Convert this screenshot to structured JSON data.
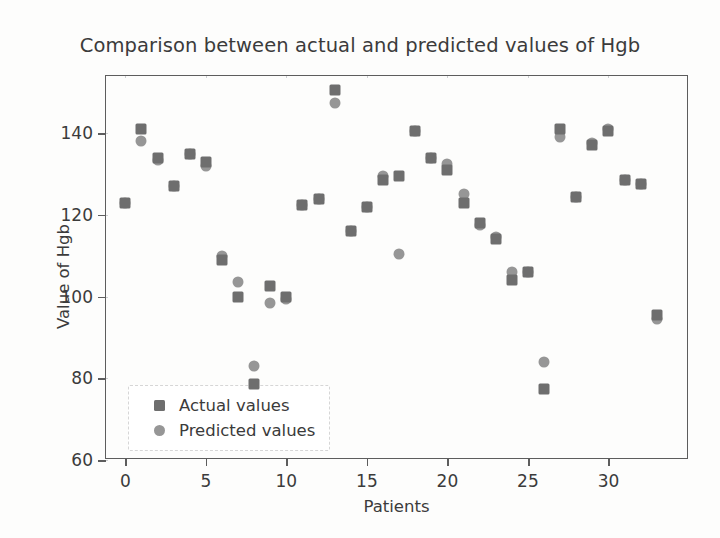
{
  "chart_data": {
    "type": "scatter",
    "title": "Comparison between actual and predicted values of Hgb",
    "xlabel": "Patients",
    "ylabel": "Value of Hgb",
    "xlim": [
      -1.2,
      35.0
    ],
    "ylim": [
      60,
      154
    ],
    "xticks": [
      0,
      5,
      10,
      15,
      20,
      25,
      30
    ],
    "yticks": [
      60,
      80,
      100,
      120,
      140
    ],
    "grid": true,
    "legend_position": "lower left",
    "colors": {
      "actual": "#6e6e6e",
      "predicted": "#969696",
      "axis": "#5d5d5d",
      "grid": "#cdcfd1",
      "text": "#3b3b3b",
      "background": "#fdfdfc"
    },
    "x": [
      0,
      1,
      2,
      3,
      4,
      5,
      6,
      7,
      8,
      9,
      10,
      11,
      12,
      13,
      14,
      15,
      16,
      17,
      18,
      19,
      20,
      21,
      22,
      23,
      24,
      25,
      26,
      27,
      28,
      29,
      30,
      31,
      32,
      33
    ],
    "series": [
      {
        "name": "Actual values",
        "marker": "square",
        "color": "#6e6e6e",
        "values": [
          123,
          141,
          134,
          127,
          135,
          133,
          109,
          100,
          78.5,
          102.5,
          100,
          122.5,
          124,
          150.5,
          116,
          122,
          128.5,
          129.5,
          140.5,
          134,
          131,
          123,
          118,
          114,
          104,
          106,
          77.5,
          141,
          124.5,
          137,
          140.5,
          128.5,
          127.5,
          95.5
        ]
      },
      {
        "name": "Predicted values",
        "marker": "circle",
        "color": "#969696",
        "values": [
          123,
          138,
          133.5,
          127,
          135,
          132,
          110,
          103.5,
          83,
          98.5,
          99.5,
          122.5,
          124,
          147.5,
          116,
          122,
          129.5,
          110.5,
          140.5,
          134,
          132.5,
          125,
          117.5,
          114.5,
          106,
          106,
          84,
          139,
          124.5,
          137.5,
          141,
          128.5,
          127.5,
          94.5
        ]
      }
    ]
  },
  "legend": {
    "items": [
      {
        "label": "Actual values",
        "marker": "square"
      },
      {
        "label": "Predicted values",
        "marker": "circle"
      }
    ]
  }
}
